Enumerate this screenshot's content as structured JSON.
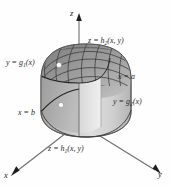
{
  "figure": {
    "kind": "3d-solid-region-diagram",
    "background_color": "#fefefe",
    "width": 172,
    "height": 187,
    "axes": {
      "z_label": "z",
      "x_label": "x",
      "y_label": "y",
      "axis_color": "#6b6b6b",
      "arrowhead_color": "#1a1a1a"
    },
    "labels": {
      "top_surface": {
        "lhs": "z",
        "eq": " = ",
        "fn": "h",
        "sub": "2",
        "args": "(x, y)"
      },
      "bottom_surface": {
        "lhs": "z",
        "eq": " = ",
        "fn": "h",
        "sub": "1",
        "args": "(x, y)"
      },
      "left_curve": {
        "lhs": "y",
        "eq": " = ",
        "fn": "g",
        "sub": "1",
        "args": "(x)"
      },
      "right_curve": {
        "lhs": "y",
        "eq": " = ",
        "fn": "g",
        "sub": "2",
        "args": "(x)"
      },
      "plane_a": "x = a",
      "plane_b": "x = b"
    },
    "solid": {
      "body_fill_light": "#e2e2e2",
      "body_fill_mid": "#c9c9c9",
      "body_fill_dark": "#a9a9a9",
      "dome_fill": "#8e8e8e",
      "mesh_color": "#3a3a3a",
      "outline_color": "#4a4a4a",
      "marker_color": "#ffffff",
      "marker_count": 2
    }
  }
}
